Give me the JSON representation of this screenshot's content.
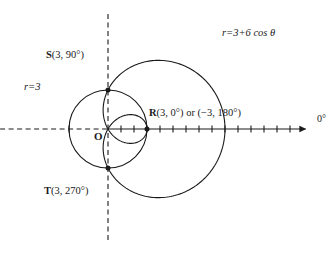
{
  "figure": {
    "stroke_color": "#1a1a1a",
    "background_color": "#ffffff"
  },
  "labels": {
    "equation": "r=3+6 cos θ",
    "circle": "r=3",
    "origin": "O",
    "axis_angle": "0°",
    "point_S_name": "S",
    "point_S_coords": "(3, 90°)",
    "point_T_name": "T",
    "point_T_coords": "(3, 270°)",
    "point_R_name": "R",
    "point_R_coords": "(3, 0°) or (−3, 180°)"
  },
  "chart_data": {
    "type": "line",
    "title": "",
    "xlabel": "",
    "ylabel": "",
    "coordinate_system": "polar",
    "axis_angle_label": "0°",
    "grid": false,
    "legend": false,
    "origin_px": {
      "x": 108,
      "y": 129
    },
    "unit_px": 13.0,
    "series": [
      {
        "name": "r=3+6 cos θ",
        "equation": "r = 3 + 6 cos(theta)",
        "type": "limacon_with_inner_loop",
        "a": 3,
        "b": 6,
        "theta_range_deg": [
          0,
          360
        ],
        "theta_step_deg": 1,
        "max_r": 9,
        "min_r": -3,
        "r_at_theta": [
          {
            "theta_deg": 0,
            "r": 9
          },
          {
            "theta_deg": 30,
            "r": 8.196
          },
          {
            "theta_deg": 60,
            "r": 6
          },
          {
            "theta_deg": 90,
            "r": 3
          },
          {
            "theta_deg": 120,
            "r": 0
          },
          {
            "theta_deg": 150,
            "r": -2.196
          },
          {
            "theta_deg": 180,
            "r": -3
          },
          {
            "theta_deg": 210,
            "r": -2.196
          },
          {
            "theta_deg": 240,
            "r": 0
          },
          {
            "theta_deg": 270,
            "r": 3
          },
          {
            "theta_deg": 300,
            "r": 6
          },
          {
            "theta_deg": 330,
            "r": 8.196
          },
          {
            "theta_deg": 360,
            "r": 9
          }
        ]
      },
      {
        "name": "r=3",
        "equation": "r = 3",
        "type": "circle",
        "radius": 3,
        "center_polar": [
          0,
          0
        ]
      }
    ],
    "points": [
      {
        "label": "S",
        "coords_text": "(3, 90°)",
        "r": 3,
        "theta_deg": 90,
        "px": {
          "x": 108,
          "y": 90
        }
      },
      {
        "label": "T",
        "coords_text": "(3, 270°)",
        "r": 3,
        "theta_deg": 270,
        "px": {
          "x": 108,
          "y": 168
        }
      },
      {
        "label": "R",
        "coords_text": "(3, 0°) or (−3, 180°)",
        "r": 3,
        "theta_deg": 0,
        "px": {
          "x": 147,
          "y": 129
        }
      },
      {
        "label": "O",
        "coords_text": "",
        "r": 0,
        "theta_deg": 0,
        "px": {
          "x": 108,
          "y": 129
        }
      }
    ],
    "axes": {
      "polar_axis_solid_from_r": 0,
      "polar_axis_solid_to_r": 15.2,
      "polar_axis_dashed_from_r": -8.3,
      "polar_axis_dashed_to_r": 0,
      "vertical_axis_dashed": true,
      "tick_spacing_r": 1,
      "tick_count_positive": 15,
      "arrowhead": true
    }
  }
}
